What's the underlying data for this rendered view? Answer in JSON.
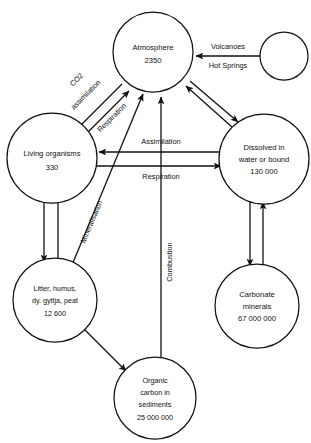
{
  "figure": {
    "kind": "carbon-cycle-flow-diagram",
    "background_color": "#ffffff",
    "line_color": "#111111",
    "width": 311,
    "height": 443
  },
  "nodes": {
    "atmosphere": {
      "line1": "Atmosphere",
      "line2": "2350"
    },
    "volcanic_source": {
      "label": ""
    },
    "living_organisms": {
      "line1": "Living organisms",
      "line2": "330"
    },
    "dissolved": {
      "line1": "Dissolved in",
      "line2": "water or bound",
      "line3": "130 000"
    },
    "litter": {
      "line1": "Litter, humus,",
      "line2": "dy. gyttja, peat",
      "line3": "12 600"
    },
    "carbonate": {
      "line1": "Carbonate",
      "line2": "minerals",
      "line3": "67 000 000"
    },
    "sediments": {
      "line1": "Organic",
      "line2": "carbon in",
      "line3": "sediments",
      "line4": "25 000 000"
    }
  },
  "edge_labels": {
    "volcanoes": "Volcanoes",
    "hot_springs": "Hot Springs",
    "co2": "CO2",
    "co2_assimilation": "assimilation",
    "respiration_diagonal": "Respiration",
    "assimilation": "Assimilation",
    "respiration": "Respiration",
    "mineralisation": "Mineralisation",
    "combustion": "Combustion"
  }
}
